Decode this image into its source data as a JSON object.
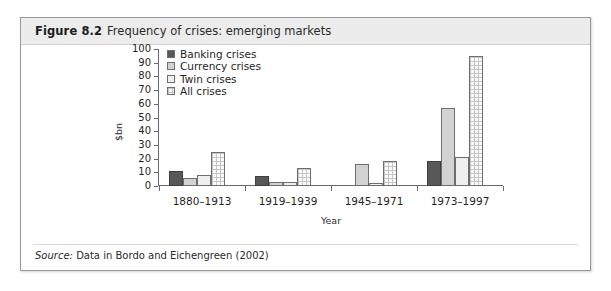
{
  "figure": {
    "number": "Figure 8.2",
    "caption": "Frequency of crises: emerging markets",
    "source_label": "Source:",
    "source_text": "Data in Bordo and Eichengreen (2002)"
  },
  "colors": {
    "banking": "#585858",
    "currency": "#d2d2d2",
    "twin": "#efefef",
    "all": "#fbfbfb",
    "axis": "#6a6a6a",
    "frame_border": "#9a9a9a",
    "title_band": "#ececec"
  },
  "chart_data": {
    "type": "bar",
    "title": "Frequency of crises: emerging markets",
    "xlabel": "Year",
    "ylabel": "$bn",
    "ylim": [
      0,
      100
    ],
    "yticks": [
      0,
      10,
      20,
      30,
      40,
      50,
      60,
      70,
      80,
      90,
      100
    ],
    "grid": false,
    "legend_position": "top-left",
    "categories": [
      "1880–1913",
      "1919–1939",
      "1945–1971",
      "1973–1997"
    ],
    "series": [
      {
        "name": "Banking crises",
        "values": [
          11,
          7,
          0,
          18
        ]
      },
      {
        "name": "Currency crises",
        "values": [
          6,
          3,
          16,
          57
        ]
      },
      {
        "name": "Twin crises",
        "values": [
          8,
          3,
          2,
          21
        ]
      },
      {
        "name": "All crises",
        "values": [
          25,
          13,
          18,
          95
        ]
      }
    ]
  }
}
